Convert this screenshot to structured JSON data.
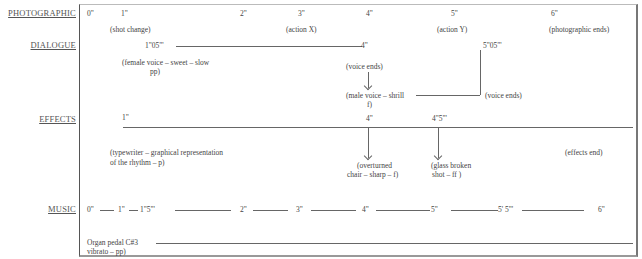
{
  "tracks": {
    "photographic": {
      "label": "PHOTOGRAPHIC",
      "times": [
        "0\"",
        "1\"",
        "2\"",
        "3\"",
        "4\"",
        "5\"",
        "6\""
      ],
      "notes": {
        "shot_change": "(shot change)",
        "action_x": "(action X)",
        "action_y": "(action Y)",
        "end": "(photographic ends)"
      }
    },
    "dialogue": {
      "label": "DIALOGUE",
      "start_time": "1\"05\"'",
      "end_time": "4\"",
      "second_time": "5\"05\"'",
      "female_line1": "(female voice – sweet – slow",
      "female_line2": "pp)",
      "voice_ends_1": "(voice ends)",
      "male_line1": "(male voice – shrill",
      "male_line2": "f)",
      "voice_ends_2": "(voice ends)"
    },
    "effects": {
      "label": "EFFECTS",
      "start_time": "1\"",
      "t4": "4\"",
      "t45": "4\"5\"'",
      "typewriter_line1": "(typewriter – graphical representation",
      "typewriter_line2": "of the rhythm – p)",
      "chair_line1": "(overturned",
      "chair_line2": "chair – sharp – f)",
      "glass_line1": "(glass broken",
      "glass_line2": "shot – ff )",
      "end": "(effects end)"
    },
    "music": {
      "label": "MUSIC",
      "times": [
        "0\"",
        "1\"",
        "1\"5\"'",
        "2\"",
        "3\"",
        "4\"",
        "5\"",
        "5' 5\"'",
        "6\""
      ],
      "organ_line1": "Organ pedal C#3",
      "organ_line2": "vibrato – pp)"
    }
  }
}
